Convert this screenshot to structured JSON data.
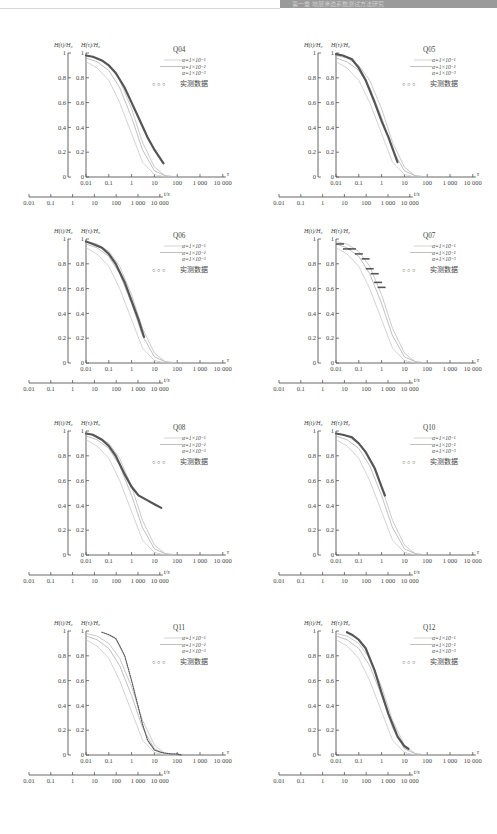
{
  "page": {
    "header_text": "第一章 地层渗透系数测试方法研究"
  },
  "legend": {
    "series_labels": [
      "α=1×10⁻¹",
      "α=1×10⁻²",
      "α=1×10⁻³"
    ],
    "measured_label": "实测数据",
    "marker_glyph": "○ ○ ○"
  },
  "axes": {
    "outer_ylabel": "H(t)/H₀",
    "inner_ylabel": "H(τ)/H₀",
    "tau_label": "τ",
    "time_label": "t/s",
    "y_ticks": [
      "0",
      "0.2",
      "0.4",
      "0.6",
      "0.8",
      "1"
    ],
    "tau_ticks": [
      "0.01",
      "0.1",
      "1",
      "10",
      "100",
      "1 000",
      "10 000"
    ],
    "time_ticks": [
      "0.01",
      "0.1",
      "1",
      "10",
      "100",
      "1 000",
      "10 000"
    ]
  },
  "colors": {
    "axis": "#555555",
    "curve_a1": "#c8c8c8",
    "curve_a2": "#b0b0b0",
    "curve_a3": "#bdbdbd",
    "measured": "#555555"
  },
  "chart_data": [
    {
      "id": "Q04",
      "type": "line",
      "title": "Q04",
      "xlabel": "τ",
      "x2label": "t/s",
      "ylabel": "H(t)/H₀ , H(τ)/H₀",
      "xscale": "log",
      "xlim": [
        0.01,
        10000
      ],
      "ylim": [
        0,
        1
      ],
      "time_offset_decades": 0.9,
      "series": [
        {
          "name": "α=1×10⁻¹",
          "x": [
            0.01,
            0.03,
            0.1,
            0.3,
            1,
            3,
            10,
            30,
            100
          ],
          "y": [
            0.93,
            0.88,
            0.78,
            0.6,
            0.35,
            0.12,
            0.02,
            0.0,
            0.0
          ]
        },
        {
          "name": "α=1×10⁻²",
          "x": [
            0.01,
            0.03,
            0.1,
            0.3,
            1,
            3,
            10,
            30,
            100
          ],
          "y": [
            0.96,
            0.93,
            0.86,
            0.72,
            0.48,
            0.22,
            0.05,
            0.01,
            0.0
          ]
        },
        {
          "name": "α=1×10⁻³",
          "x": [
            0.01,
            0.03,
            0.1,
            0.3,
            1,
            3,
            10,
            30,
            100
          ],
          "y": [
            0.98,
            0.96,
            0.9,
            0.78,
            0.55,
            0.28,
            0.08,
            0.01,
            0.0
          ]
        },
        {
          "name": "实测数据",
          "measured": true,
          "x": [
            0.01,
            0.02,
            0.05,
            0.1,
            0.2,
            0.5,
            1,
            2,
            5,
            10,
            25
          ],
          "y": [
            0.98,
            0.97,
            0.94,
            0.9,
            0.84,
            0.72,
            0.6,
            0.48,
            0.32,
            0.22,
            0.11
          ]
        }
      ]
    },
    {
      "id": "Q05",
      "type": "line",
      "title": "Q05",
      "xlabel": "τ",
      "x2label": "t/s",
      "ylabel": "H(t)/H₀ , H(τ)/H₀",
      "xscale": "log",
      "xlim": [
        0.01,
        10000
      ],
      "ylim": [
        0,
        1
      ],
      "time_offset_decades": 1.8,
      "series": [
        {
          "name": "α=1×10⁻¹",
          "x": [
            0.01,
            0.03,
            0.1,
            0.3,
            1,
            3,
            10,
            30,
            100
          ],
          "y": [
            0.93,
            0.88,
            0.78,
            0.6,
            0.35,
            0.12,
            0.02,
            0.0,
            0.0
          ]
        },
        {
          "name": "α=1×10⁻²",
          "x": [
            0.01,
            0.03,
            0.1,
            0.3,
            1,
            3,
            10,
            30,
            100
          ],
          "y": [
            0.96,
            0.93,
            0.86,
            0.72,
            0.48,
            0.22,
            0.05,
            0.01,
            0.0
          ]
        },
        {
          "name": "α=1×10⁻³",
          "x": [
            0.01,
            0.03,
            0.1,
            0.3,
            1,
            3,
            10,
            30,
            100
          ],
          "y": [
            0.98,
            0.96,
            0.9,
            0.78,
            0.55,
            0.28,
            0.08,
            0.01,
            0.0
          ]
        },
        {
          "name": "实测数据",
          "measured": true,
          "x": [
            0.01,
            0.02,
            0.05,
            0.1,
            0.2,
            0.5,
            1,
            2,
            5
          ],
          "y": [
            0.99,
            0.98,
            0.95,
            0.88,
            0.78,
            0.6,
            0.45,
            0.32,
            0.12
          ]
        }
      ]
    },
    {
      "id": "Q06",
      "type": "line",
      "title": "Q06",
      "xlabel": "τ",
      "x2label": "t/s",
      "ylabel": "H(t)/H₀ , H(τ)/H₀",
      "xscale": "log",
      "xlim": [
        0.01,
        10000
      ],
      "ylim": [
        0,
        1
      ],
      "time_offset_decades": 2.5,
      "series": [
        {
          "name": "α=1×10⁻¹",
          "x": [
            0.01,
            0.03,
            0.1,
            0.3,
            1,
            3,
            10,
            30,
            100
          ],
          "y": [
            0.93,
            0.88,
            0.78,
            0.6,
            0.35,
            0.12,
            0.02,
            0.0,
            0.0
          ]
        },
        {
          "name": "α=1×10⁻²",
          "x": [
            0.01,
            0.03,
            0.1,
            0.3,
            1,
            3,
            10,
            30,
            100
          ],
          "y": [
            0.96,
            0.93,
            0.86,
            0.72,
            0.48,
            0.22,
            0.05,
            0.01,
            0.0
          ]
        },
        {
          "name": "α=1×10⁻³",
          "x": [
            0.01,
            0.03,
            0.1,
            0.3,
            1,
            3,
            10,
            30,
            100
          ],
          "y": [
            0.98,
            0.96,
            0.9,
            0.78,
            0.55,
            0.28,
            0.08,
            0.01,
            0.0
          ]
        },
        {
          "name": "实测数据",
          "measured": true,
          "x": [
            0.01,
            0.02,
            0.05,
            0.1,
            0.2,
            0.5,
            1,
            2,
            3.5
          ],
          "y": [
            0.98,
            0.96,
            0.93,
            0.88,
            0.8,
            0.65,
            0.5,
            0.35,
            0.21
          ]
        }
      ]
    },
    {
      "id": "Q07",
      "type": "line",
      "title": "Q07",
      "xlabel": "τ",
      "x2label": "t/s",
      "ylabel": "H(t)/H₀ , H(τ)/H₀",
      "xscale": "log",
      "xlim": [
        0.01,
        10000
      ],
      "ylim": [
        0,
        1
      ],
      "time_offset_decades": 3.0,
      "series": [
        {
          "name": "α=1×10⁻¹",
          "x": [
            0.01,
            0.03,
            0.1,
            0.3,
            1,
            3,
            10,
            30,
            100
          ],
          "y": [
            0.93,
            0.88,
            0.78,
            0.6,
            0.35,
            0.12,
            0.02,
            0.0,
            0.0
          ]
        },
        {
          "name": "α=1×10⁻²",
          "x": [
            0.01,
            0.03,
            0.1,
            0.3,
            1,
            3,
            10,
            30,
            100
          ],
          "y": [
            0.96,
            0.93,
            0.86,
            0.72,
            0.48,
            0.22,
            0.05,
            0.01,
            0.0
          ]
        },
        {
          "name": "α=1×10⁻³",
          "x": [
            0.01,
            0.03,
            0.1,
            0.3,
            1,
            3,
            10,
            30,
            100
          ],
          "y": [
            0.98,
            0.96,
            0.9,
            0.78,
            0.55,
            0.28,
            0.08,
            0.01,
            0.0
          ]
        },
        {
          "name": "实测数据",
          "measured": true,
          "x": [
            0.015,
            0.03,
            0.05,
            0.1,
            0.2,
            0.3,
            0.5,
            0.7,
            1.0
          ],
          "y": [
            0.96,
            0.92,
            0.92,
            0.88,
            0.84,
            0.76,
            0.72,
            0.65,
            0.61
          ]
        }
      ]
    },
    {
      "id": "Q08",
      "type": "line",
      "title": "Q08",
      "xlabel": "τ",
      "x2label": "t/s",
      "ylabel": "H(t)/H₀ , H(τ)/H₀",
      "xscale": "log",
      "xlim": [
        0.01,
        10000
      ],
      "ylim": [
        0,
        1
      ],
      "time_offset_decades": 2.0,
      "series": [
        {
          "name": "α=1×10⁻¹",
          "x": [
            0.01,
            0.03,
            0.1,
            0.3,
            1,
            3,
            10,
            30,
            100
          ],
          "y": [
            0.93,
            0.88,
            0.78,
            0.6,
            0.35,
            0.12,
            0.02,
            0.0,
            0.0
          ]
        },
        {
          "name": "α=1×10⁻²",
          "x": [
            0.01,
            0.03,
            0.1,
            0.3,
            1,
            3,
            10,
            30,
            100
          ],
          "y": [
            0.96,
            0.93,
            0.86,
            0.72,
            0.48,
            0.22,
            0.05,
            0.01,
            0.0
          ]
        },
        {
          "name": "α=1×10⁻³",
          "x": [
            0.01,
            0.03,
            0.1,
            0.3,
            1,
            3,
            10,
            30,
            100
          ],
          "y": [
            0.98,
            0.96,
            0.9,
            0.78,
            0.55,
            0.28,
            0.08,
            0.01,
            0.0
          ]
        },
        {
          "name": "实测数据",
          "measured": true,
          "x": [
            0.01,
            0.02,
            0.05,
            0.1,
            0.2,
            0.5,
            1,
            2,
            5,
            10,
            20
          ],
          "y": [
            0.98,
            0.97,
            0.93,
            0.88,
            0.8,
            0.65,
            0.55,
            0.48,
            0.44,
            0.41,
            0.38
          ]
        }
      ]
    },
    {
      "id": "Q10",
      "type": "line",
      "title": "Q10",
      "xlabel": "τ",
      "x2label": "t/s",
      "ylabel": "H(t)/H₀ , H(τ)/H₀",
      "xscale": "log",
      "xlim": [
        0.01,
        10000
      ],
      "ylim": [
        0,
        1
      ],
      "time_offset_decades": 3.0,
      "series": [
        {
          "name": "α=1×10⁻¹",
          "x": [
            0.01,
            0.03,
            0.1,
            0.3,
            1,
            3,
            10,
            30,
            100
          ],
          "y": [
            0.93,
            0.88,
            0.78,
            0.6,
            0.35,
            0.12,
            0.02,
            0.0,
            0.0
          ]
        },
        {
          "name": "α=1×10⁻²",
          "x": [
            0.01,
            0.03,
            0.1,
            0.3,
            1,
            3,
            10,
            30,
            100
          ],
          "y": [
            0.96,
            0.93,
            0.86,
            0.72,
            0.48,
            0.22,
            0.05,
            0.01,
            0.0
          ]
        },
        {
          "name": "α=1×10⁻³",
          "x": [
            0.01,
            0.03,
            0.1,
            0.3,
            1,
            3,
            10,
            30,
            100
          ],
          "y": [
            0.98,
            0.96,
            0.9,
            0.78,
            0.55,
            0.28,
            0.08,
            0.01,
            0.0
          ]
        },
        {
          "name": "实测数据",
          "measured": true,
          "x": [
            0.01,
            0.02,
            0.05,
            0.1,
            0.2,
            0.5,
            1,
            1.4
          ],
          "y": [
            0.98,
            0.97,
            0.95,
            0.9,
            0.83,
            0.7,
            0.55,
            0.48
          ]
        }
      ]
    },
    {
      "id": "Q11",
      "type": "line",
      "title": "Q11",
      "xlabel": "τ",
      "x2label": "t/s",
      "ylabel": "H(t)/H₀ , H(τ)/H₀",
      "xscale": "log",
      "xlim": [
        0.01,
        10000
      ],
      "ylim": [
        0,
        1
      ],
      "time_offset_decades": 2.0,
      "series": [
        {
          "name": "α=1×10⁻¹",
          "x": [
            0.01,
            0.03,
            0.1,
            0.3,
            1,
            3,
            10,
            30,
            100
          ],
          "y": [
            0.93,
            0.88,
            0.78,
            0.6,
            0.35,
            0.12,
            0.02,
            0.0,
            0.0
          ]
        },
        {
          "name": "α=1×10⁻²",
          "x": [
            0.01,
            0.03,
            0.1,
            0.3,
            1,
            3,
            10,
            30,
            100
          ],
          "y": [
            0.96,
            0.93,
            0.86,
            0.72,
            0.48,
            0.22,
            0.05,
            0.01,
            0.0
          ]
        },
        {
          "name": "α=1×10⁻³",
          "x": [
            0.01,
            0.03,
            0.1,
            0.3,
            1,
            3,
            10,
            30,
            100
          ],
          "y": [
            0.98,
            0.96,
            0.9,
            0.78,
            0.55,
            0.28,
            0.08,
            0.01,
            0.0
          ]
        },
        {
          "name": "实测数据",
          "measured": true,
          "x": [
            0.05,
            0.1,
            0.2,
            0.3,
            0.5,
            1,
            2,
            3,
            5,
            10,
            20,
            50,
            100,
            150
          ],
          "y": [
            0.99,
            0.97,
            0.94,
            0.88,
            0.8,
            0.6,
            0.38,
            0.25,
            0.12,
            0.04,
            0.02,
            0.01,
            0.01,
            0.0
          ]
        }
      ]
    },
    {
      "id": "Q12",
      "type": "line",
      "title": "Q12",
      "xlabel": "τ",
      "x2label": "t/s",
      "ylabel": "H(t)/H₀ , H(τ)/H₀",
      "xscale": "log",
      "xlim": [
        0.01,
        10000
      ],
      "ylim": [
        0,
        1
      ],
      "time_offset_decades": 2.0,
      "series": [
        {
          "name": "α=1×10⁻¹",
          "x": [
            0.01,
            0.03,
            0.1,
            0.3,
            1,
            3,
            10,
            30,
            100
          ],
          "y": [
            0.93,
            0.88,
            0.78,
            0.6,
            0.35,
            0.12,
            0.02,
            0.0,
            0.0
          ]
        },
        {
          "name": "α=1×10⁻²",
          "x": [
            0.01,
            0.03,
            0.1,
            0.3,
            1,
            3,
            10,
            30,
            100
          ],
          "y": [
            0.96,
            0.93,
            0.86,
            0.72,
            0.48,
            0.22,
            0.05,
            0.01,
            0.0
          ]
        },
        {
          "name": "α=1×10⁻³",
          "x": [
            0.01,
            0.03,
            0.1,
            0.3,
            1,
            3,
            10,
            30,
            100
          ],
          "y": [
            0.98,
            0.96,
            0.9,
            0.78,
            0.55,
            0.28,
            0.08,
            0.01,
            0.0
          ]
        },
        {
          "name": "实测数据",
          "measured": true,
          "x": [
            0.03,
            0.05,
            0.1,
            0.2,
            0.5,
            1,
            2,
            5,
            10,
            15
          ],
          "y": [
            0.99,
            0.97,
            0.93,
            0.86,
            0.68,
            0.5,
            0.33,
            0.15,
            0.07,
            0.05
          ]
        }
      ]
    }
  ],
  "panels_layout": [
    {
      "id": "Q04",
      "left": 0,
      "top": 40
    },
    {
      "id": "Q05",
      "left": 250,
      "top": 40
    },
    {
      "id": "Q06",
      "left": 0,
      "top": 226
    },
    {
      "id": "Q07",
      "left": 250,
      "top": 226
    },
    {
      "id": "Q08",
      "left": 0,
      "top": 418
    },
    {
      "id": "Q10",
      "left": 250,
      "top": 418
    },
    {
      "id": "Q11",
      "left": 0,
      "top": 618
    },
    {
      "id": "Q12",
      "left": 250,
      "top": 618
    }
  ]
}
